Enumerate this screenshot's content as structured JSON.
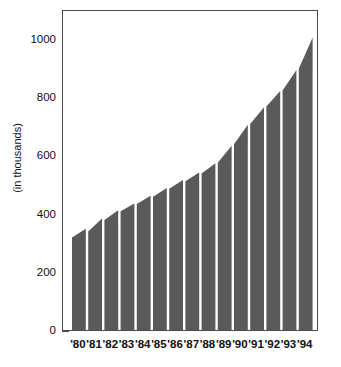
{
  "chart_data": {
    "type": "bar",
    "title": "",
    "subtitle": "",
    "xlabel": "",
    "ylabel": "(in thousands)",
    "categories": [
      "'80",
      "'81",
      "'82",
      "'83",
      "'84",
      "'85",
      "'86",
      "'87",
      "'88",
      "'89",
      "'90",
      "'91",
      "'92",
      "'93",
      "'94"
    ],
    "values": [
      330,
      365,
      400,
      425,
      450,
      478,
      505,
      530,
      560,
      612,
      682,
      748,
      800,
      862,
      1010
    ],
    "bar_top_start_values": [
      325,
      345,
      385,
      415,
      440,
      465,
      492,
      518,
      545,
      582,
      645,
      715,
      775,
      830,
      905
    ],
    "bar_top_end_values": [
      355,
      390,
      418,
      442,
      468,
      495,
      522,
      548,
      580,
      640,
      712,
      772,
      828,
      900,
      1012
    ],
    "ylim": [
      0,
      1100
    ],
    "yticks": [
      0,
      200,
      400,
      600,
      800,
      1000
    ],
    "ytick_labels": [
      "0",
      "200",
      "400",
      "600",
      "800",
      "1000"
    ],
    "grid": false,
    "legend": null,
    "bar_color": "#5a5a5a",
    "axis_color": "#4a4a4a",
    "background_color": "#ffffff",
    "text_color": "#111111"
  }
}
